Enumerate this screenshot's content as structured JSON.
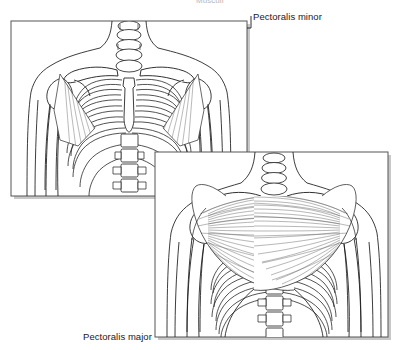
{
  "figure": {
    "title_cropped": "Musculi",
    "background_color": "#ffffff",
    "line_color": "#1a1a1a",
    "muscle_fiber_color": "#3a3a3a",
    "panel_border_color": "#555555",
    "shadow_color": "#9a9a9a"
  },
  "labels": {
    "pectoralis_minor": "Pectoralis minor",
    "pectoralis_major": "Pectoralis major"
  },
  "panels": [
    {
      "id": "upper-panel",
      "name": "pectoralis-minor-panel",
      "x": 11,
      "y": 21,
      "width": 236,
      "height": 175,
      "view": "anterior thorax with pectoralis minor"
    },
    {
      "id": "lower-panel",
      "name": "pectoralis-major-panel",
      "x": 155,
      "y": 152,
      "width": 233,
      "height": 185,
      "view": "anterior thorax with pectoralis major"
    }
  ],
  "anatomy": {
    "upper": [
      "clavicle",
      "scapula",
      "humerus",
      "ribs",
      "sternum",
      "cervical vertebrae",
      "lumbar vertebrae",
      "pectoralis minor"
    ],
    "lower": [
      "clavicle",
      "humerus",
      "ribs",
      "sternum",
      "cervical vertebrae",
      "lumbar vertebrae",
      "pectoralis major"
    ]
  }
}
